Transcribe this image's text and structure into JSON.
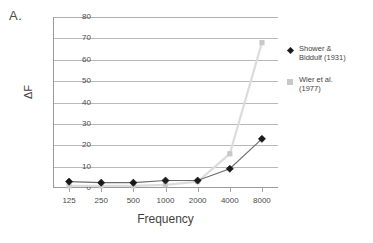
{
  "panel": {
    "letter": "A."
  },
  "chart_data": {
    "type": "line",
    "title": "",
    "xlabel": "Frequency",
    "ylabel": "ΔF",
    "categories": [
      "125",
      "250",
      "500",
      "1000",
      "2000",
      "4000",
      "8000"
    ],
    "ylim": [
      0,
      80
    ],
    "yticks": [
      "0",
      "10",
      "20",
      "30",
      "40",
      "50",
      "60",
      "70",
      "80"
    ],
    "grid": true,
    "legend_position": "right-outside",
    "series": [
      {
        "name": "Shower & Biddulf (1931)",
        "legend_line1": "Shower &",
        "legend_line2": "Biddulf (1931)",
        "marker": "diamond",
        "color": "#1a1a1a",
        "line_color": "#6b6b6b",
        "values": [
          3,
          2.5,
          2.5,
          3.5,
          3.5,
          9,
          23
        ]
      },
      {
        "name": "Wier et al. (1977)",
        "legend_line1": "Wier et al.",
        "legend_line2": "(1977)",
        "marker": "square",
        "color": "#c9c9c9",
        "line_color": "#dcdcdc",
        "values": [
          1,
          1,
          1,
          1.5,
          3,
          16,
          68
        ]
      }
    ]
  }
}
